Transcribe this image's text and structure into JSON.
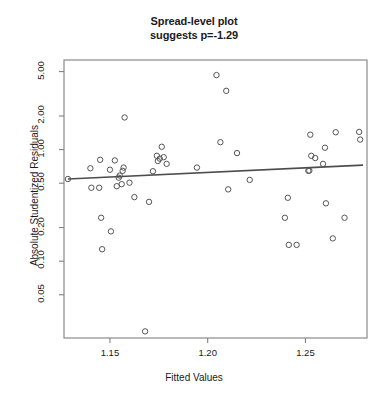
{
  "chart_data": {
    "type": "scatter",
    "title": "Spread-level plot suggests p=-1.29",
    "title_lines": [
      "Spread-level plot",
      "suggests p=-1.29"
    ],
    "xlabel": "Fitted Values",
    "ylabel": "Absolute Studentized Residuals",
    "yscale": "log",
    "xscale": "linear",
    "grid": false,
    "legend": null,
    "xlim": [
      1.1265,
      1.2815
    ],
    "ylim": [
      0.0205,
      6.35
    ],
    "xticks": [
      1.15,
      1.2,
      1.25
    ],
    "xtick_labels": [
      "1.15",
      "1.20",
      "1.25"
    ],
    "yticks": [
      0.05,
      0.1,
      0.2,
      0.5,
      1.0,
      2.0,
      5.0
    ],
    "ytick_labels": [
      "0.05",
      "0.10",
      "0.20",
      "0.50",
      "1.00",
      "2.00",
      "5.00"
    ],
    "marker": "open-circle",
    "marker_color": "#555555",
    "points": [
      {
        "x": 1.1285,
        "y": 0.545
      },
      {
        "x": 1.14,
        "y": 0.68
      },
      {
        "x": 1.1405,
        "y": 0.455
      },
      {
        "x": 1.1445,
        "y": 0.455
      },
      {
        "x": 1.145,
        "y": 0.81
      },
      {
        "x": 1.1455,
        "y": 0.245
      },
      {
        "x": 1.146,
        "y": 0.128
      },
      {
        "x": 1.15,
        "y": 0.66
      },
      {
        "x": 1.1505,
        "y": 0.185
      },
      {
        "x": 1.1525,
        "y": 0.8
      },
      {
        "x": 1.1535,
        "y": 0.47
      },
      {
        "x": 1.1545,
        "y": 0.56
      },
      {
        "x": 1.155,
        "y": 0.585
      },
      {
        "x": 1.156,
        "y": 0.49
      },
      {
        "x": 1.1565,
        "y": 0.645
      },
      {
        "x": 1.157,
        "y": 0.69
      },
      {
        "x": 1.1575,
        "y": 1.94
      },
      {
        "x": 1.16,
        "y": 0.505
      },
      {
        "x": 1.1625,
        "y": 0.375
      },
      {
        "x": 1.168,
        "y": 0.0235
      },
      {
        "x": 1.17,
        "y": 0.34
      },
      {
        "x": 1.172,
        "y": 0.64
      },
      {
        "x": 1.174,
        "y": 0.88
      },
      {
        "x": 1.1745,
        "y": 0.79
      },
      {
        "x": 1.1755,
        "y": 0.83
      },
      {
        "x": 1.1765,
        "y": 1.06
      },
      {
        "x": 1.1775,
        "y": 0.855
      },
      {
        "x": 1.179,
        "y": 0.745
      },
      {
        "x": 1.1945,
        "y": 0.69
      },
      {
        "x": 1.2045,
        "y": 4.65
      },
      {
        "x": 1.2065,
        "y": 1.165
      },
      {
        "x": 1.2095,
        "y": 3.36
      },
      {
        "x": 1.2105,
        "y": 0.44
      },
      {
        "x": 1.215,
        "y": 0.93
      },
      {
        "x": 1.2215,
        "y": 0.535
      },
      {
        "x": 1.2395,
        "y": 0.245
      },
      {
        "x": 1.241,
        "y": 0.37
      },
      {
        "x": 1.2415,
        "y": 0.14
      },
      {
        "x": 1.2455,
        "y": 0.14
      },
      {
        "x": 1.2515,
        "y": 0.645
      },
      {
        "x": 1.252,
        "y": 0.648
      },
      {
        "x": 1.2525,
        "y": 1.36
      },
      {
        "x": 1.253,
        "y": 0.88
      },
      {
        "x": 1.255,
        "y": 0.84
      },
      {
        "x": 1.259,
        "y": 0.745
      },
      {
        "x": 1.26,
        "y": 1.04
      },
      {
        "x": 1.2605,
        "y": 0.33
      },
      {
        "x": 1.264,
        "y": 0.16
      },
      {
        "x": 1.2655,
        "y": 1.43
      },
      {
        "x": 1.27,
        "y": 0.245
      },
      {
        "x": 1.2775,
        "y": 1.44
      },
      {
        "x": 1.278,
        "y": 1.23
      }
    ],
    "trend_line": {
      "color": "#4d4d4d",
      "x_start": 1.1285,
      "y_start": 0.545,
      "x_end": 1.2795,
      "y_end": 0.726
    }
  }
}
